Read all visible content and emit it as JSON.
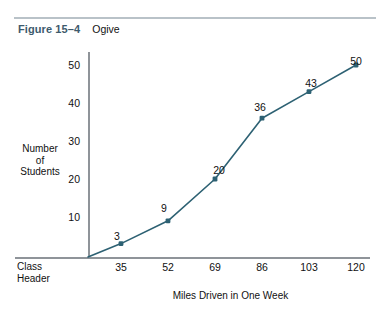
{
  "header": {
    "figure_number": "Figure 15–4",
    "figure_title": "Ogive"
  },
  "colors": {
    "figure_number": "#3d5a6c",
    "series": "#2d6173",
    "axis": "#8f9499",
    "rule": "#b9c2c8"
  },
  "axes": {
    "y_label_line1": "Number",
    "y_label_line2": "of",
    "y_label_line3": "Students",
    "x_label": "Miles Driven in One Week",
    "class_header_line1": "Class",
    "class_header_line2": "Header"
  },
  "chart_data": {
    "type": "line",
    "title": "Ogive",
    "xlabel": "Miles Driven in One Week",
    "ylabel": "Number of Students",
    "categories": [
      "35",
      "52",
      "69",
      "86",
      "103",
      "120"
    ],
    "values": [
      3,
      9,
      20,
      36,
      43,
      50
    ],
    "point_labels": [
      "3",
      "9",
      "20",
      "36",
      "43",
      "50"
    ],
    "yticks": [
      "10",
      "20",
      "30",
      "40",
      "50"
    ],
    "ytick_values": [
      10,
      20,
      30,
      40,
      50
    ],
    "xticks": [
      "35",
      "52",
      "69",
      "86",
      "103",
      "120"
    ],
    "ylim": [
      0,
      55
    ],
    "grid": false,
    "legend": null,
    "marker": "square-dot",
    "series_color": "#2d6173",
    "origin_note": "line begins at the y-axis baseline below the first plotted point"
  }
}
